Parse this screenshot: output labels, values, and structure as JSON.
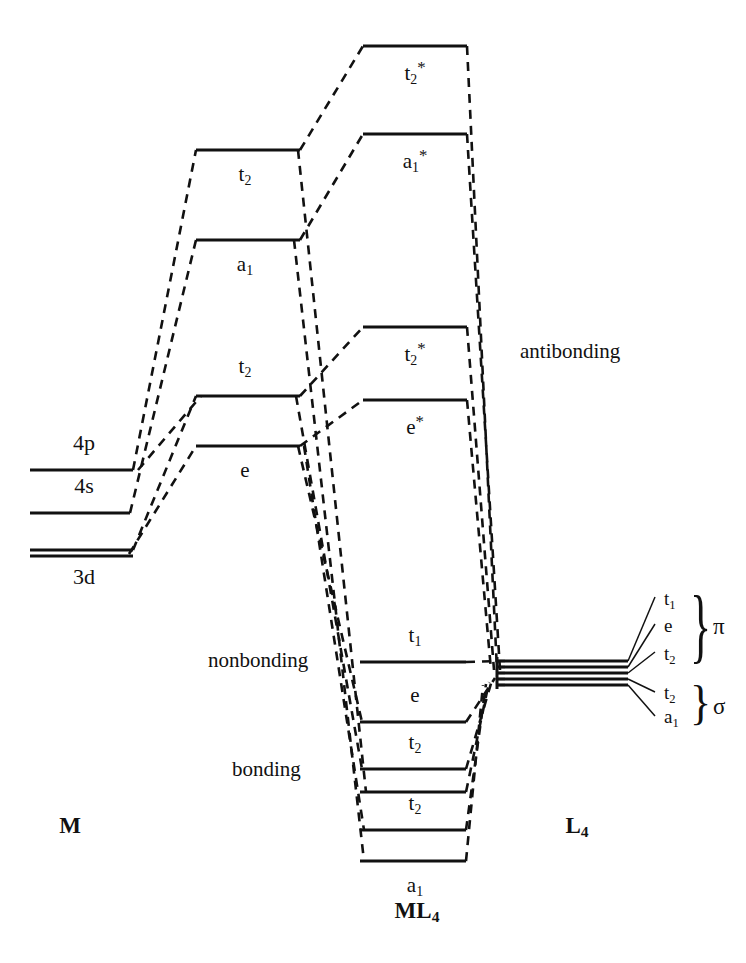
{
  "figure": {
    "line_color": "#111111",
    "background": "#ffffff"
  },
  "axis_labels": {
    "metal": "M",
    "complex_prefix": "ML",
    "complex_sub": "4",
    "ligand_prefix": "L",
    "ligand_sub": "4"
  },
  "region_labels": {
    "antibonding": "antibonding",
    "nonbonding": "nonbonding",
    "bonding": "bonding"
  },
  "metal_levels": [
    {
      "label": "4p",
      "y": 470,
      "x1": 30,
      "x2": 133,
      "double": false,
      "label_x": 84,
      "label_y": 452,
      "label_pos": "above"
    },
    {
      "label": "4s",
      "y": 513,
      "x1": 30,
      "x2": 130,
      "double": false,
      "label_x": 84,
      "label_y": 495,
      "label_pos": "above"
    },
    {
      "label": "3d",
      "y": 550,
      "x1": 30,
      "x2": 133,
      "double": true,
      "label_x": 84,
      "label_y": 560,
      "label_pos": "below"
    }
  ],
  "hybrid_levels": [
    {
      "label": "t",
      "sub": "2",
      "star": false,
      "y": 150,
      "x1": 196,
      "x2": 300,
      "label_x": 245,
      "label_y": 160,
      "label_pos": "below"
    },
    {
      "label": "a",
      "sub": "1",
      "star": false,
      "y": 240,
      "x1": 196,
      "x2": 300,
      "label_x": 245,
      "label_y": 250,
      "label_pos": "below"
    },
    {
      "label": "t",
      "sub": "2",
      "star": false,
      "y": 396,
      "x1": 196,
      "x2": 300,
      "label_x": 245,
      "label_y": 372,
      "label_pos": "above"
    },
    {
      "label": "e",
      "sub": "",
      "star": false,
      "y": 446,
      "x1": 196,
      "x2": 300,
      "label_x": 245,
      "label_y": 456,
      "label_pos": "below"
    }
  ],
  "mo_antibonding": [
    {
      "label": "t",
      "sub": "2",
      "star": true,
      "y": 46,
      "x1": 363,
      "x2": 467,
      "label_x": 415,
      "label_y": 56,
      "label_pos": "below"
    },
    {
      "label": "a",
      "sub": "1",
      "star": true,
      "y": 134,
      "x1": 363,
      "x2": 467,
      "label_x": 415,
      "label_y": 144,
      "label_pos": "below"
    },
    {
      "label": "t",
      "sub": "2",
      "star": true,
      "y": 327,
      "x1": 363,
      "x2": 467,
      "label_x": 415,
      "label_y": 337,
      "label_pos": "below"
    },
    {
      "label": "e",
      "sub": "",
      "star": true,
      "y": 400,
      "x1": 363,
      "x2": 467,
      "label_x": 415,
      "label_y": 410,
      "label_pos": "below"
    }
  ],
  "mo_nonbonding": [
    {
      "label": "t",
      "sub": "1",
      "star": false,
      "y": 662,
      "x1": 360,
      "x2": 466,
      "label_x": 415,
      "label_y": 641,
      "label_pos": "above"
    }
  ],
  "mo_bonding": [
    {
      "label": "e",
      "sub": "",
      "star": false,
      "y": 722,
      "x1": 360,
      "x2": 466,
      "label_x": 415,
      "label_y": 701,
      "label_pos": "above"
    },
    {
      "label": "t",
      "sub": "2",
      "star": false,
      "y": 769,
      "x1": 360,
      "x2": 466,
      "label_x": 415,
      "label_y": 748,
      "label_pos": "above"
    },
    {
      "label": "",
      "sub": "",
      "star": false,
      "y": 792,
      "x1": 360,
      "x2": 466,
      "label_x": 0,
      "label_y": 0,
      "label_pos": "none"
    },
    {
      "label": "t",
      "sub": "2",
      "star": false,
      "y": 830,
      "x1": 360,
      "x2": 466,
      "label_x": 415,
      "label_y": 809,
      "label_pos": "above"
    },
    {
      "label": "a",
      "sub": "1",
      "star": false,
      "y": 861,
      "x1": 360,
      "x2": 466,
      "label_x": 415,
      "label_y": 871,
      "label_pos": "below"
    }
  ],
  "ligand_stack": {
    "x1": 505,
    "x2": 628,
    "converge_x": 497,
    "converge_y": 670,
    "lines": [
      {
        "y": 661
      },
      {
        "y": 667
      },
      {
        "y": 673
      },
      {
        "y": 679
      },
      {
        "y": 685
      }
    ]
  },
  "ligand_fan_labels": [
    {
      "label": "t",
      "sub": "1",
      "x": 664,
      "y": 600,
      "leader_from_x": 628,
      "leader_from_y": 661,
      "leader_to_x": 655,
      "leader_to_y": 597
    },
    {
      "label": "e",
      "sub": "",
      "x": 664,
      "y": 627,
      "leader_from_x": 628,
      "leader_from_y": 667,
      "leader_to_x": 655,
      "leader_to_y": 624
    },
    {
      "label": "t",
      "sub": "2",
      "x": 664,
      "y": 655,
      "leader_from_x": 628,
      "leader_from_y": 673,
      "leader_to_x": 655,
      "leader_to_y": 652
    },
    {
      "label": "t",
      "sub": "2",
      "x": 664,
      "y": 694,
      "leader_from_x": 628,
      "leader_from_y": 679,
      "leader_to_x": 655,
      "leader_to_y": 692
    },
    {
      "label": "a",
      "sub": "1",
      "x": 664,
      "y": 718,
      "leader_from_x": 628,
      "leader_from_y": 685,
      "leader_to_x": 655,
      "leader_to_y": 716
    }
  ],
  "symmetry_groups": [
    {
      "symbol": "π",
      "name": "pi",
      "x": 713,
      "y": 628,
      "brace_x": 690,
      "brace_top": 586,
      "brace_bottom": 668
    },
    {
      "symbol": "σ",
      "name": "sigma",
      "x": 713,
      "y": 708,
      "brace_x": 690,
      "brace_top": 680,
      "brace_bottom": 728
    }
  ]
}
